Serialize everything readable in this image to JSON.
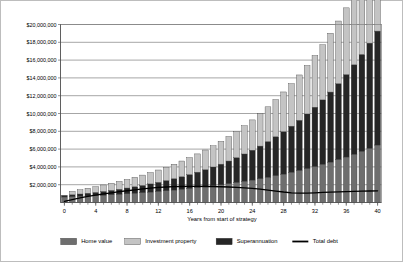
{
  "chart_data": {
    "type": "bar",
    "title": "",
    "subtitle": "",
    "xlabel": "Years from start of strategy",
    "ylabel": "",
    "stacked": true,
    "grid": true,
    "legend_position": "bottom",
    "xlim": [
      0,
      40
    ],
    "ylim": [
      0,
      20000000
    ],
    "ytick_labels": [
      "$20,000,000",
      "$18,000,000",
      "$16,000,000",
      "$14,000,000",
      "$12,000,000",
      "$10,000,000",
      "$8,000,000",
      "$6,000,000",
      "$4,000,000",
      "$2,000,000"
    ],
    "ytick_values": [
      20000000,
      18000000,
      16000000,
      14000000,
      12000000,
      10000000,
      8000000,
      6000000,
      4000000,
      2000000
    ],
    "xtick_labels": [
      "0",
      "4",
      "8",
      "12",
      "16",
      "20",
      "24",
      "28",
      "32",
      "36",
      "40"
    ],
    "xtick_values": [
      0,
      4,
      8,
      12,
      16,
      20,
      24,
      28,
      32,
      36,
      40
    ],
    "categories": [
      0,
      1,
      2,
      3,
      4,
      5,
      6,
      7,
      8,
      9,
      10,
      11,
      12,
      13,
      14,
      15,
      16,
      17,
      18,
      19,
      20,
      21,
      22,
      23,
      24,
      25,
      26,
      27,
      28,
      29,
      30,
      31,
      32,
      33,
      34,
      35,
      36,
      37,
      38,
      39,
      40
    ],
    "series": [
      {
        "name": "Home value",
        "color": "#6e6e6e",
        "stack_order": 1,
        "values": [
          620000,
          650000,
          690000,
          730000,
          770000,
          820000,
          870000,
          920000,
          980000,
          1040000,
          1100000,
          1170000,
          1240000,
          1320000,
          1400000,
          1480000,
          1570000,
          1670000,
          1770000,
          1880000,
          1990000,
          2110000,
          2240000,
          2380000,
          2520000,
          2670000,
          2840000,
          3010000,
          3190000,
          3390000,
          3590000,
          3810000,
          4040000,
          4280000,
          4540000,
          4820000,
          5110000,
          5420000,
          5740000,
          6090000,
          6460000
        ]
      },
      {
        "name": "Superannuation",
        "color": "#262626",
        "stack_order": 2,
        "values": [
          180000,
          220000,
          265000,
          315000,
          370000,
          430000,
          495000,
          565000,
          645000,
          730000,
          820000,
          920000,
          1030000,
          1150000,
          1280000,
          1420000,
          1570000,
          1740000,
          1920000,
          2110000,
          2320000,
          2550000,
          2800000,
          3070000,
          3360000,
          3670000,
          4010000,
          4380000,
          4770000,
          5190000,
          5650000,
          6140000,
          6670000,
          7250000,
          7870000,
          8540000,
          9270000,
          10050000,
          10900000,
          11820000,
          12800000
        ]
      },
      {
        "name": "Investment property",
        "color": "#c4c4c4",
        "stack_order": 3,
        "values": [
          0,
          380000,
          480000,
          560000,
          640000,
          720000,
          800000,
          880000,
          960000,
          1060000,
          1160000,
          1270000,
          1380000,
          1500000,
          1620000,
          1760000,
          1900000,
          2050000,
          2210000,
          2380000,
          2560000,
          2750000,
          2950000,
          3170000,
          3400000,
          3640000,
          3900000,
          4170000,
          4460000,
          4770000,
          5090000,
          5440000,
          5800000,
          6190000,
          6600000,
          7030000,
          7490000,
          7970000,
          8480000,
          9030000,
          9600000
        ]
      }
    ],
    "overlay_series": [
      {
        "name": "Total debt",
        "type": "line",
        "color": "#000000",
        "values": [
          120000,
          330000,
          520000,
          680000,
          820000,
          960000,
          1090000,
          1210000,
          1320000,
          1420000,
          1520000,
          1610000,
          1690000,
          1740000,
          1780000,
          1800000,
          1810000,
          1810000,
          1800000,
          1790000,
          1770000,
          1740000,
          1700000,
          1650000,
          1580000,
          1500000,
          1400000,
          1290000,
          1180000,
          1090000,
          1050000,
          1060000,
          1090000,
          1130000,
          1170000,
          1200000,
          1230000,
          1250000,
          1270000,
          1290000,
          1310000
        ]
      }
    ],
    "legend": [
      {
        "label": "Home value",
        "color": "#6e6e6e",
        "marker": "swatch"
      },
      {
        "label": "Investment property",
        "color": "#c4c4c4",
        "marker": "swatch"
      },
      {
        "label": "Superannuation",
        "color": "#262626",
        "marker": "swatch"
      },
      {
        "label": "Total debt",
        "color": "#000000",
        "marker": "line"
      }
    ]
  }
}
